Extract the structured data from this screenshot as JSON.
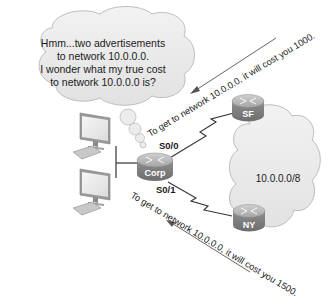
{
  "diagram": {
    "thought_bubble": {
      "lines": [
        "Hmm...two advertisements",
        "to network 10.0.0.0.",
        "I wonder what my true cost",
        "to network 10.0.0.0 is?"
      ]
    },
    "routers": {
      "corp": {
        "label": "Corp"
      },
      "sf": {
        "label": "SF"
      },
      "ny": {
        "label": "NY"
      }
    },
    "interfaces": {
      "s0_0": "S0/0",
      "s0_1": "S0/1"
    },
    "network_cloud": {
      "label": "10.0.0.0/8"
    },
    "advertisements": {
      "from_sf": "To get to network 10.0.0.0, it will cost you 1000.",
      "from_ny": "To get to network 10.0.0.0, it will cost you 1500."
    },
    "hosts": [
      {
        "name": "workstation-1"
      },
      {
        "name": "workstation-2"
      }
    ],
    "colors": {
      "router_body": "#8c8c8c",
      "router_top": "#b8b8b8",
      "cloud_fill": "#ececec",
      "cloud_stroke": "#bdbdbd",
      "monitor_frame": "#9a9a9a",
      "monitor_screen": "#efefef",
      "line": "#333333"
    }
  }
}
